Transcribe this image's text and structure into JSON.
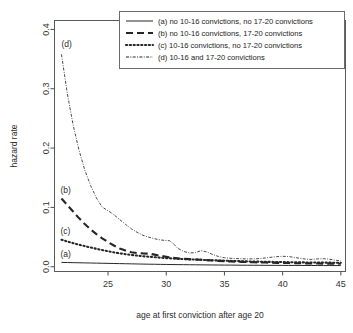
{
  "chart_data": {
    "type": "line",
    "title": "",
    "xlabel": "age at first conviction after age 20",
    "ylabel": "hazard rate",
    "xlim": [
      20.4,
      45.4
    ],
    "ylim": [
      -0.008,
      0.415
    ],
    "xticks": [
      25,
      30,
      35,
      40,
      45
    ],
    "yticks": [
      0.0,
      0.1,
      0.2,
      0.3,
      0.4
    ],
    "xtick_labels": [
      "25",
      "30",
      "35",
      "40",
      "45"
    ],
    "ytick_labels": [
      "0.0",
      "0.1",
      "0.2",
      "0.3",
      "0.4"
    ],
    "grid": false,
    "legend_position": "top-right",
    "series": [
      {
        "key": "a",
        "name": "(a) no 10-16 convictions, no 17-20 convictions",
        "linestyle": "solid",
        "inplot_label": "(a)",
        "x": [
          21,
          21.5,
          22,
          22.5,
          23,
          23.5,
          24,
          24.5,
          25,
          25.5,
          26,
          26.5,
          27,
          27.5,
          28,
          28.5,
          29,
          29.5,
          30,
          30.5,
          31,
          31.5,
          32,
          32.5,
          33,
          33.5,
          34,
          34.5,
          35,
          35.5,
          36,
          36.5,
          37,
          37.5,
          38,
          38.5,
          39,
          39.5,
          40,
          40.5,
          41,
          41.5,
          42,
          42.5,
          43,
          43.5,
          44,
          44.5,
          45
        ],
        "y": [
          0.0073,
          0.0071,
          0.0069,
          0.0067,
          0.0065,
          0.0063,
          0.0061,
          0.0059,
          0.0057,
          0.0055,
          0.0053,
          0.0051,
          0.0049,
          0.0047,
          0.0045,
          0.0043,
          0.0042,
          0.004,
          0.0039,
          0.0037,
          0.0036,
          0.0035,
          0.0034,
          0.0033,
          0.0032,
          0.0031,
          0.003,
          0.0029,
          0.0028,
          0.0028,
          0.0027,
          0.0026,
          0.0026,
          0.0025,
          0.0025,
          0.0024,
          0.0024,
          0.0023,
          0.0023,
          0.0022,
          0.0022,
          0.0022,
          0.0021,
          0.0021,
          0.0021,
          0.002,
          0.002,
          0.002,
          0.002
        ]
      },
      {
        "key": "b",
        "name": "(b) no 10-16 convictions,  17-20 convictions",
        "linestyle": "dashed",
        "inplot_label": "(b)",
        "x": [
          21,
          21.5,
          22,
          22.5,
          23,
          23.5,
          24,
          24.5,
          25,
          25.5,
          26,
          26.5,
          27,
          27.5,
          28,
          28.5,
          29,
          29.5,
          30,
          30.5,
          31,
          31.5,
          32,
          32.5,
          33,
          33.5,
          34,
          34.5,
          35,
          35.5,
          36,
          36.5,
          37,
          37.5,
          38,
          38.5,
          39,
          39.5,
          40,
          40.5,
          41,
          41.5,
          42,
          42.5,
          43,
          43.5,
          44,
          44.5,
          45
        ],
        "y": [
          0.115,
          0.104,
          0.093,
          0.082,
          0.072,
          0.063,
          0.055,
          0.048,
          0.0415,
          0.0358,
          0.0308,
          0.0272,
          0.0245,
          0.0232,
          0.0225,
          0.0221,
          0.0204,
          0.0185,
          0.0168,
          0.0152,
          0.0141,
          0.0134,
          0.0129,
          0.0123,
          0.0117,
          0.0111,
          0.0105,
          0.0099,
          0.0094,
          0.009,
          0.0086,
          0.0082,
          0.0079,
          0.0076,
          0.0073,
          0.0071,
          0.0068,
          0.0066,
          0.0064,
          0.0062,
          0.006,
          0.0058,
          0.0057,
          0.0055,
          0.0054,
          0.0053,
          0.0052,
          0.0051,
          0.005
        ]
      },
      {
        "key": "c",
        "name": "(c) 10-16 convictions, no 17-20 convictions",
        "linestyle": "dotted",
        "inplot_label": "(c)",
        "x": [
          21,
          21.5,
          22,
          22.5,
          23,
          23.5,
          24,
          24.5,
          25,
          25.5,
          26,
          26.5,
          27,
          27.5,
          28,
          28.5,
          29,
          29.5,
          30,
          30.5,
          31,
          31.5,
          32,
          32.5,
          33,
          33.5,
          34,
          34.5,
          35,
          35.5,
          36,
          36.5,
          37,
          37.5,
          38,
          38.5,
          39,
          39.5,
          40,
          40.5,
          41,
          41.5,
          42,
          42.5,
          43,
          43.5,
          44,
          44.5,
          45
        ],
        "y": [
          0.0455,
          0.0425,
          0.0398,
          0.0372,
          0.0348,
          0.0325,
          0.0303,
          0.0282,
          0.0262,
          0.0243,
          0.0226,
          0.0212,
          0.0199,
          0.0188,
          0.0178,
          0.0169,
          0.0161,
          0.0153,
          0.0146,
          0.014,
          0.0134,
          0.0129,
          0.0125,
          0.0121,
          0.0117,
          0.0113,
          0.0109,
          0.0106,
          0.0102,
          0.0099,
          0.0096,
          0.0093,
          0.009,
          0.0088,
          0.0086,
          0.0084,
          0.0082,
          0.008,
          0.0079,
          0.0077,
          0.0076,
          0.0074,
          0.0073,
          0.0072,
          0.0071,
          0.007,
          0.0069,
          0.0068,
          0.0067
        ]
      },
      {
        "key": "d",
        "name": "(d) 10-16 and 17-20 convictions",
        "linestyle": "dotdash-fine",
        "inplot_label": "(d)",
        "x": [
          21,
          21.5,
          22,
          22.5,
          23,
          23.5,
          24,
          24.5,
          25,
          25.3,
          25.7,
          26,
          26.5,
          27,
          27.5,
          28,
          28.5,
          29,
          29.5,
          30,
          30.3,
          30.7,
          31,
          31.5,
          32,
          32.5,
          33,
          33.5,
          34,
          34.5,
          35,
          35.5,
          36,
          36.5,
          37,
          37.5,
          38,
          38.5,
          39,
          39.5,
          40,
          40.5,
          41,
          41.5,
          42,
          42.5,
          43,
          43.5,
          44,
          44.5,
          45
        ],
        "y": [
          0.358,
          0.292,
          0.239,
          0.197,
          0.163,
          0.137,
          0.116,
          0.1005,
          0.0945,
          0.0905,
          0.0845,
          0.0795,
          0.0715,
          0.064,
          0.058,
          0.053,
          0.0498,
          0.0472,
          0.0452,
          0.0442,
          0.0438,
          0.0372,
          0.031,
          0.0258,
          0.0232,
          0.0238,
          0.0272,
          0.0248,
          0.0205,
          0.0172,
          0.0152,
          0.0143,
          0.0138,
          0.0134,
          0.0132,
          0.0133,
          0.0138,
          0.0148,
          0.016,
          0.017,
          0.0176,
          0.0172,
          0.0158,
          0.0142,
          0.0128,
          0.0124,
          0.0132,
          0.0136,
          0.0128,
          0.0112,
          0.0098
        ]
      }
    ]
  },
  "legend": {
    "entries": [
      {
        "label": "(a) no 10-16 convictions, no 17-20 convictions"
      },
      {
        "label": "(b) no 10-16 convictions,  17-20 convictions"
      },
      {
        "label": "(c) 10-16 convictions, no 17-20 convictions"
      },
      {
        "label": "(d) 10-16 and 17-20 convictions"
      }
    ]
  },
  "axes": {
    "x_title": "age at first conviction after age 20",
    "y_title": "hazard rate",
    "x_tick_labels": [
      "25",
      "30",
      "35",
      "40",
      "45"
    ],
    "y_tick_labels": [
      "0.0",
      "0.1",
      "0.2",
      "0.3",
      "0.4"
    ]
  },
  "inplot_labels": {
    "a": "(a)",
    "b": "(b)",
    "c": "(c)",
    "d": "(d)"
  },
  "colors": {
    "background": "#ffffff",
    "ink": "#262626",
    "axis": "#4d4d4d",
    "curve_d": "#4a4a4a"
  }
}
